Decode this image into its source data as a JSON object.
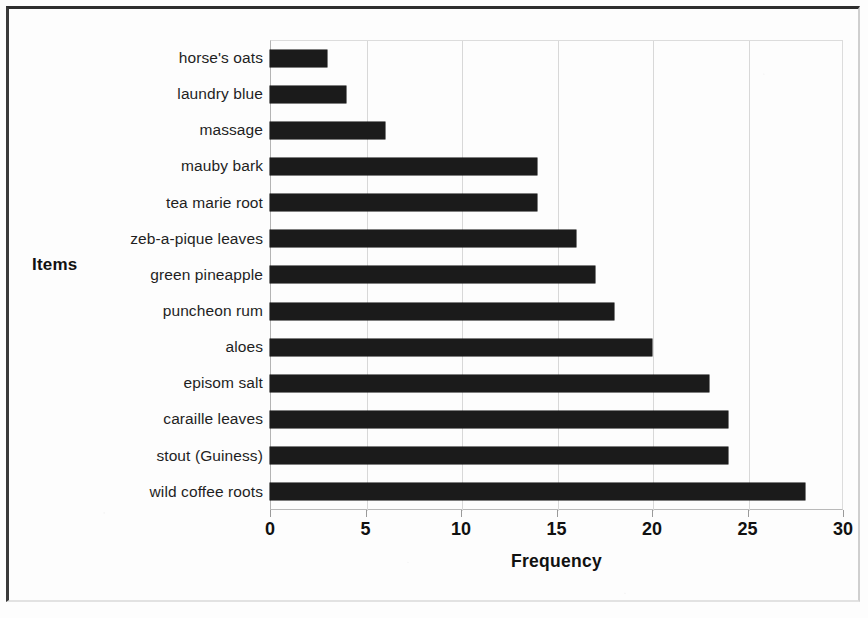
{
  "chart_data": {
    "type": "bar",
    "orientation": "horizontal",
    "title": "",
    "xlabel": "Frequency",
    "ylabel": "Items",
    "xlim": [
      0,
      30
    ],
    "xticks": [
      0,
      5,
      10,
      15,
      20,
      25,
      30
    ],
    "xtick_labels": [
      "0",
      "5",
      "10",
      "15",
      "20",
      "25",
      "30"
    ],
    "grid": true,
    "grid_axis": "x",
    "legend": false,
    "bar_color": "#1b1b1b",
    "categories": [
      "horse's oats",
      "laundry blue",
      "massage",
      "mauby bark",
      "tea marie root",
      "zeb-a-pique leaves",
      "green pineapple",
      "puncheon rum",
      "aloes",
      "episom salt",
      "caraille leaves",
      "stout (Guiness)",
      "wild coffee roots"
    ],
    "values": [
      3,
      4,
      6,
      14,
      14,
      16,
      17,
      18,
      20,
      23,
      24,
      24,
      28
    ]
  }
}
